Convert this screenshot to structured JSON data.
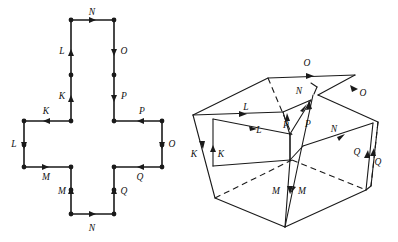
{
  "figure": {
    "background_color": "#ffffff",
    "ink_color": "#1a1a1a",
    "panels": [
      {
        "id": "net",
        "name": "cross-net-panel",
        "description": "Planar cross (plus-sign) shaped polygon with 12 boundary edges carrying directed identification labels",
        "labels": [
          "N",
          "L",
          "O",
          "K",
          "P",
          "K",
          "P",
          "L",
          "O",
          "M",
          "Q",
          "M",
          "Q",
          "N"
        ]
      },
      {
        "id": "solid",
        "name": "folded-box-panel",
        "description": "Three dimensional open-box / folded solid showing the same edge identifications in pairs",
        "labels": [
          "O",
          "L",
          "N",
          "O",
          "L",
          "P",
          "P",
          "N",
          "K",
          "K",
          "Q",
          "Q",
          "M",
          "M"
        ]
      }
    ],
    "net_labels": [
      {
        "id": "n-top",
        "text": "N",
        "x": 92,
        "y": 13
      },
      {
        "id": "l-upper",
        "text": "L",
        "x": 62,
        "y": 52
      },
      {
        "id": "o-upper",
        "text": "O",
        "x": 124,
        "y": 52
      },
      {
        "id": "k-upvert",
        "text": "K",
        "x": 62,
        "y": 97
      },
      {
        "id": "p-upvert",
        "text": "P",
        "x": 124,
        "y": 97
      },
      {
        "id": "k-left",
        "text": "K",
        "x": 46,
        "y": 114
      },
      {
        "id": "p-right",
        "text": "P",
        "x": 142,
        "y": 114
      },
      {
        "id": "l-left",
        "text": "L",
        "x": 14,
        "y": 145
      },
      {
        "id": "o-right",
        "text": "O",
        "x": 172,
        "y": 145
      },
      {
        "id": "m-left",
        "text": "M",
        "x": 46,
        "y": 178
      },
      {
        "id": "q-right",
        "text": "Q",
        "x": 140,
        "y": 178
      },
      {
        "id": "m-lovert",
        "text": "M",
        "x": 62,
        "y": 192
      },
      {
        "id": "q-lovert",
        "text": "Q",
        "x": 124,
        "y": 192
      },
      {
        "id": "n-bottom",
        "text": "N",
        "x": 92,
        "y": 229
      }
    ],
    "solid_labels": [
      {
        "id": "o-top",
        "text": "O",
        "x": 307,
        "y": 64
      },
      {
        "id": "l-top",
        "text": "L",
        "x": 246,
        "y": 108
      },
      {
        "id": "n-top",
        "text": "N",
        "x": 300,
        "y": 92
      },
      {
        "id": "o-right",
        "text": "O",
        "x": 363,
        "y": 94
      },
      {
        "id": "l-front",
        "text": "L",
        "x": 259,
        "y": 131
      },
      {
        "id": "p-left",
        "text": "P",
        "x": 289,
        "y": 126
      },
      {
        "id": "p-right",
        "text": "P",
        "x": 308,
        "y": 125
      },
      {
        "id": "n-front",
        "text": "N",
        "x": 334,
        "y": 130
      },
      {
        "id": "k-outer",
        "text": "K",
        "x": 195,
        "y": 155
      },
      {
        "id": "k-inner",
        "text": "K",
        "x": 221,
        "y": 155
      },
      {
        "id": "q-left",
        "text": "Q",
        "x": 358,
        "y": 153
      },
      {
        "id": "q-right",
        "text": "Q",
        "x": 377,
        "y": 162
      },
      {
        "id": "m-left",
        "text": "M",
        "x": 276,
        "y": 192
      },
      {
        "id": "m-right",
        "text": "M",
        "x": 302,
        "y": 192
      }
    ]
  }
}
